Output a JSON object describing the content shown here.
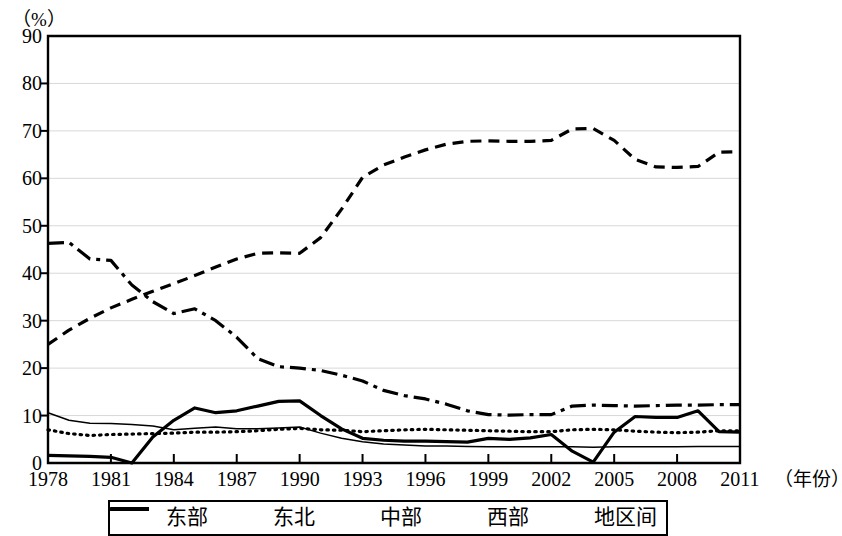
{
  "chart_data": {
    "type": "line",
    "title": "",
    "ylabel": "（%）",
    "xlabel": "（年份）",
    "ylim": [
      0,
      90
    ],
    "yticks": [
      0,
      10,
      20,
      30,
      40,
      50,
      60,
      70,
      80,
      90
    ],
    "xlim": [
      1978,
      2011
    ],
    "xticks": [
      1978,
      1981,
      1984,
      1987,
      1990,
      1993,
      1996,
      1999,
      2002,
      2005,
      2008,
      2011
    ],
    "grid": true,
    "legend_position": "bottom",
    "x": [
      1978,
      1979,
      1980,
      1981,
      1982,
      1983,
      1984,
      1985,
      1986,
      1987,
      1988,
      1989,
      1990,
      1991,
      1992,
      1993,
      1994,
      1995,
      1996,
      1997,
      1998,
      1999,
      2000,
      2001,
      2002,
      2003,
      2004,
      2005,
      2006,
      2007,
      2008,
      2009,
      2010,
      2011
    ],
    "series": [
      {
        "name": "东部",
        "style": "dashed",
        "values": [
          25.0,
          28.0,
          30.5,
          32.7,
          34.5,
          36.2,
          37.8,
          39.5,
          41.3,
          43.0,
          44.2,
          44.3,
          44.2,
          47.5,
          53.5,
          60.2,
          62.8,
          64.5,
          66.0,
          67.2,
          67.8,
          67.9,
          67.8,
          67.8,
          68.0,
          70.4,
          70.5,
          68.0,
          64.0,
          62.4,
          62.3,
          62.5,
          65.5,
          65.6
        ]
      },
      {
        "name": "东北",
        "style": "solid-thick",
        "values": [
          1.6,
          1.5,
          1.4,
          1.2,
          0.0,
          5.5,
          9.0,
          11.6,
          10.6,
          11.0,
          12.0,
          13.0,
          13.1,
          10.0,
          7.2,
          5.2,
          4.8,
          4.6,
          4.6,
          4.5,
          4.4,
          5.2,
          5.0,
          5.3,
          6.0,
          2.5,
          0.2,
          6.5,
          9.8,
          9.6,
          9.6,
          11.0,
          6.6,
          6.5
        ]
      },
      {
        "name": "中部",
        "style": "solid-thin",
        "values": [
          10.6,
          9.0,
          8.4,
          8.3,
          8.1,
          7.8,
          7.0,
          7.3,
          7.6,
          7.2,
          7.2,
          7.4,
          7.6,
          6.3,
          5.2,
          4.5,
          4.0,
          3.8,
          3.6,
          3.6,
          3.5,
          3.4,
          3.4,
          3.4,
          3.4,
          3.4,
          3.3,
          3.4,
          3.4,
          3.4,
          3.4,
          3.5,
          3.5,
          3.5
        ]
      },
      {
        "name": "西部",
        "style": "dotted",
        "values": [
          7.0,
          6.2,
          5.8,
          6.0,
          6.1,
          6.2,
          6.3,
          6.5,
          6.5,
          6.6,
          6.8,
          7.1,
          7.3,
          7.0,
          6.9,
          6.6,
          6.8,
          7.0,
          7.1,
          7.0,
          6.9,
          6.8,
          6.7,
          6.6,
          6.6,
          7.0,
          7.1,
          7.0,
          6.7,
          6.5,
          6.4,
          6.5,
          6.8,
          6.8
        ]
      },
      {
        "name": "地区间",
        "style": "dash-dot",
        "values": [
          46.3,
          46.5,
          43.0,
          42.7,
          37.5,
          34.0,
          31.5,
          32.5,
          30.0,
          26.5,
          22.0,
          20.3,
          20.0,
          19.5,
          18.5,
          17.3,
          15.3,
          14.2,
          13.5,
          12.4,
          11.0,
          10.2,
          10.1,
          10.2,
          10.2,
          12.0,
          12.2,
          12.1,
          12.0,
          12.1,
          12.2,
          12.2,
          12.3,
          12.3
        ]
      }
    ]
  },
  "legend": {
    "items": [
      {
        "label": "东部",
        "style": "dashed"
      },
      {
        "label": "东北",
        "style": "solid-thick"
      },
      {
        "label": "中部",
        "style": "solid-thin"
      },
      {
        "label": "西部",
        "style": "dotted"
      },
      {
        "label": "地区间",
        "style": "dash-dot"
      }
    ]
  },
  "colors": {
    "line": "#000000",
    "grid": "#d8d8d8",
    "axis": "#000000",
    "background": "#ffffff"
  }
}
